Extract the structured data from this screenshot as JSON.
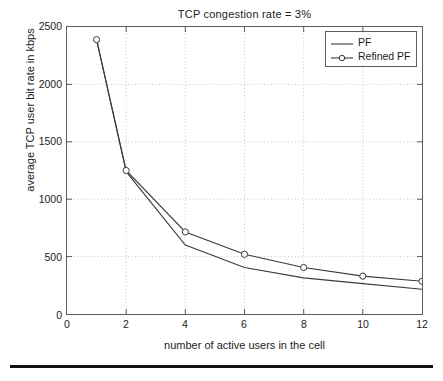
{
  "chart_data": {
    "type": "line",
    "title": "TCP congestion rate = 3%",
    "xlabel": "number of active users in the cell",
    "ylabel": "average TCP user bit rate in kbps",
    "xlim": [
      0,
      12
    ],
    "ylim": [
      0,
      2500
    ],
    "xticks": [
      0,
      2,
      4,
      6,
      8,
      10,
      12
    ],
    "yticks": [
      0,
      500,
      1000,
      1500,
      2000,
      2500
    ],
    "grid": true,
    "legend_position": "top-right",
    "x": [
      1,
      2,
      4,
      6,
      8,
      10,
      12
    ],
    "series": [
      {
        "name": "PF",
        "marker": "none",
        "values": [
          2390,
          1240,
          600,
          405,
          315,
          265,
          215
        ]
      },
      {
        "name": "Refined PF",
        "marker": "circle",
        "values": [
          2390,
          1250,
          715,
          520,
          405,
          330,
          285
        ]
      }
    ]
  },
  "figure": {
    "title": "TCP congestion rate = 3%",
    "axes": {
      "x_label": "number of active users in the cell",
      "y_label": "average TCP user bit rate in kbps",
      "x_tick_labels": [
        "0",
        "2",
        "4",
        "6",
        "8",
        "10",
        "12"
      ],
      "y_tick_labels": [
        "0",
        "500",
        "1000",
        "1500",
        "2000",
        "2500"
      ]
    },
    "legend": {
      "entries": [
        {
          "label": "PF",
          "marker": "line"
        },
        {
          "label": "Refined PF",
          "marker": "line-circle"
        }
      ]
    },
    "colors": {
      "line": "#3b3b3b",
      "axis": "#5c5c5c",
      "grid": "#b8b8b8",
      "text": "#1d1d1d",
      "rule": "#121212"
    }
  }
}
